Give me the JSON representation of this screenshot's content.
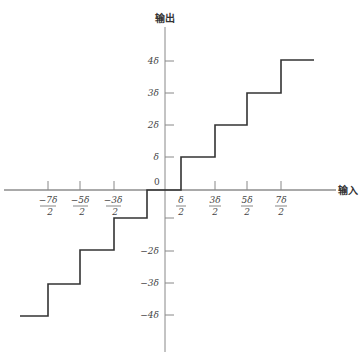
{
  "diagram": {
    "y_axis_label": "输出",
    "x_axis_label": "输入",
    "origin_label": "0",
    "y_ticks": [
      {
        "label": "4δ",
        "value": 4
      },
      {
        "label": "3δ",
        "value": 3
      },
      {
        "label": "2δ",
        "value": 2
      },
      {
        "label": "δ",
        "value": 1
      },
      {
        "label": "",
        "value": -1
      },
      {
        "label": "−2δ",
        "value": -2
      },
      {
        "label": "−3δ",
        "value": -3
      },
      {
        "label": "−4δ",
        "value": -4
      }
    ],
    "x_ticks": [
      {
        "num": "−7δ",
        "den": "2",
        "value": -3.5
      },
      {
        "num": "−5δ",
        "den": "2",
        "value": -2.5
      },
      {
        "num": "−3δ",
        "den": "2",
        "value": -1.5
      },
      {
        "num": "δ",
        "den": "2",
        "value": 0.5
      },
      {
        "num": "3δ",
        "den": "2",
        "value": 1.5
      },
      {
        "num": "5δ",
        "den": "2",
        "value": 2.5
      },
      {
        "num": "7δ",
        "den": "2",
        "value": 3.5
      }
    ],
    "staircase": [
      {
        "x_from": -4.4,
        "x_to": -3.5,
        "y": -4
      },
      {
        "x_from": -3.5,
        "x_to": -2.5,
        "y": -3
      },
      {
        "x_from": -2.5,
        "x_to": -1.5,
        "y": -2
      },
      {
        "x_from": -1.5,
        "x_to": -0.5,
        "y": -1
      },
      {
        "x_from": -0.5,
        "x_to": 0.5,
        "y": 0
      },
      {
        "x_from": 0.5,
        "x_to": 1.5,
        "y": 1
      },
      {
        "x_from": 1.5,
        "x_to": 2.5,
        "y": 2
      },
      {
        "x_from": 2.5,
        "x_to": 3.5,
        "y": 3
      },
      {
        "x_from": 3.5,
        "x_to": 4.5,
        "y": 4
      }
    ],
    "colors": {
      "axis": "#888888",
      "curve": "#333333",
      "text": "#444444"
    }
  }
}
